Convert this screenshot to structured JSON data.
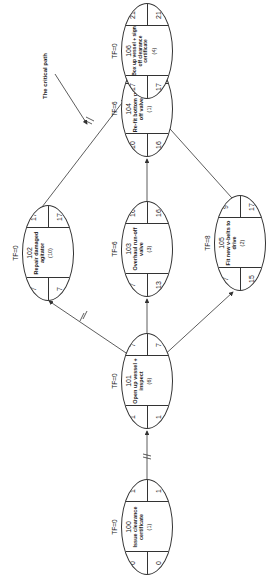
{
  "diagram": {
    "type": "activity-on-node network",
    "annotation": "The critical path",
    "nodes": [
      {
        "id": "100",
        "tf": "TF=0",
        "desc": "Issue clearance certificate",
        "dur": "(1)",
        "es": "0",
        "ls": "0",
        "ef": "1",
        "lf": "1"
      },
      {
        "id": "101",
        "tf": "TF=0",
        "desc": "Open up vessel + inspect",
        "dur": "(6)",
        "es": "1",
        "ls": "1",
        "ef": "7",
        "lf": "7"
      },
      {
        "id": "102",
        "tf": "TF=0",
        "desc": "Repair damaged agitator",
        "dur": "(10)",
        "es": "7",
        "ls": "7",
        "ef": "17",
        "lf": "17"
      },
      {
        "id": "103",
        "tf": "TF=6",
        "desc": "Overhaul run-off valve",
        "dur": "(3)",
        "es": "7",
        "ls": "13",
        "ef": "10",
        "lf": "16"
      },
      {
        "id": "104",
        "tf": "TF=6",
        "desc": "Re-fit bottom run-off valve",
        "dur": "(1)",
        "es": "10",
        "ls": "16",
        "ef": "11",
        "lf": "17"
      },
      {
        "id": "105",
        "tf": "TF=8",
        "desc": "Fit new v-belts to drive",
        "dur": "(2)",
        "es": "7",
        "ls": "15",
        "ef": "9",
        "lf": "17"
      },
      {
        "id": "106",
        "tf": "TF=0",
        "desc": "Box up vessel + sign off clearance certificate",
        "dur": "(4)",
        "es": "17",
        "ls": "17",
        "ef": "21",
        "lf": "21"
      }
    ],
    "edges": [
      {
        "from": "100",
        "to": "101",
        "critical": true
      },
      {
        "from": "101",
        "to": "102",
        "critical": true
      },
      {
        "from": "101",
        "to": "103",
        "critical": false
      },
      {
        "from": "101",
        "to": "105",
        "critical": false
      },
      {
        "from": "103",
        "to": "104",
        "critical": false
      },
      {
        "from": "102",
        "to": "106",
        "critical": true
      },
      {
        "from": "104",
        "to": "106",
        "critical": false
      },
      {
        "from": "105",
        "to": "106",
        "critical": false
      }
    ]
  }
}
